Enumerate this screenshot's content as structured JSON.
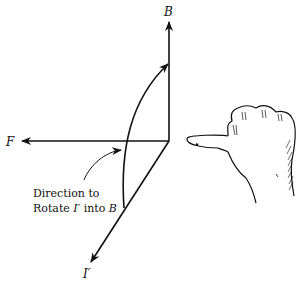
{
  "diagram": {
    "axes": {
      "B": "B",
      "F": "F",
      "I_prime": "I′"
    },
    "annotation": {
      "line1": "Direction to",
      "line2_prefix": "Rotate ",
      "line2_var1": "I′",
      "line2_mid": " into ",
      "line2_var2": "B"
    },
    "hand": "right-hand-thumb-left",
    "colors": {
      "ink": "#111111",
      "background": "#ffffff"
    }
  }
}
